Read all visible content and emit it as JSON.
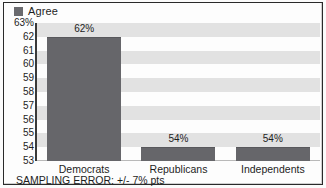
{
  "legend": {
    "swatch_name": "series-swatch",
    "label": "Agree",
    "color": "#6a6a6e"
  },
  "footer": {
    "note": "SAMPLING ERROR: +/- 7% pts"
  },
  "chart_data": {
    "type": "bar",
    "title": "",
    "subtitle": "",
    "xlabel": "",
    "ylabel": "",
    "categories": [
      "Democrats",
      "Republicans",
      "Independents"
    ],
    "values": [
      62,
      54,
      54
    ],
    "value_labels": [
      "62%",
      "54%",
      "54%"
    ],
    "series": [
      {
        "name": "Agree",
        "values": [
          62,
          54,
          54
        ],
        "color": "#66666a"
      }
    ],
    "ylim": [
      53,
      63
    ],
    "ytick_values": [
      63,
      62,
      61,
      60,
      59,
      58,
      57,
      56,
      55,
      54,
      53
    ],
    "ytick_labels": [
      "63%",
      "62",
      "61",
      "60",
      "59",
      "58",
      "57",
      "56",
      "55",
      "54",
      "53"
    ],
    "grid": "horizontal-alternating-bands",
    "legend_position": "top-left",
    "annotations": [
      "SAMPLING ERROR: +/- 7% pts"
    ],
    "colors": {
      "bar": "#66666a",
      "band_shade": "#e2e2e2",
      "band_light": "#fdfdfd",
      "axis": "#3a3a3a",
      "text": "#1d1d1d",
      "frame": "#2a2a2a"
    }
  }
}
